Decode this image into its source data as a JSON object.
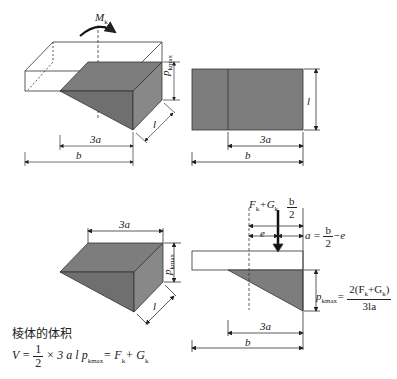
{
  "colors": {
    "fill": "#7a7a7a",
    "line": "#222222",
    "background": "#ffffff"
  },
  "fig_top_left": {
    "moment_label": "M",
    "moment_sub": "k",
    "p_label": "p",
    "p_sub": "kmax",
    "l_label": "l",
    "dim_3a": "3a",
    "dim_b": "b"
  },
  "fig_top_right": {
    "l_label": "l",
    "dim_3a": "3a",
    "dim_b": "b"
  },
  "fig_bottom_left": {
    "dim_3a": "3a",
    "p_label": "p",
    "p_sub": "kmax",
    "l_label": "l",
    "caption": "棱体的体积",
    "volume_formula": {
      "lhs": "V =",
      "frac_num": "1",
      "frac_den": "2",
      "rest": "× 3 a l p",
      "rest_sub": "kmax",
      "rhs": "= F",
      "rhs_sub1": "k",
      "plus": "+ G",
      "rhs_sub2": "k"
    }
  },
  "fig_bottom_right": {
    "force_label": "F",
    "force_sub1": "k",
    "force_plus": "+G",
    "force_sub2": "k",
    "half_b_num": "b",
    "half_b_den": "2",
    "e_label": "e",
    "a_formula_lhs": "a =",
    "a_formula_num": "b",
    "a_formula_den": "2",
    "a_formula_tail": "−e",
    "p_label": "p",
    "p_sub": "kmax",
    "p_eq": "=",
    "p_num": "2(F",
    "p_num_sub1": "k",
    "p_num_mid": "+G",
    "p_num_sub2": "k",
    "p_num_end": ")",
    "p_den": "3la",
    "dim_3a": "3a",
    "dim_b": "b"
  }
}
